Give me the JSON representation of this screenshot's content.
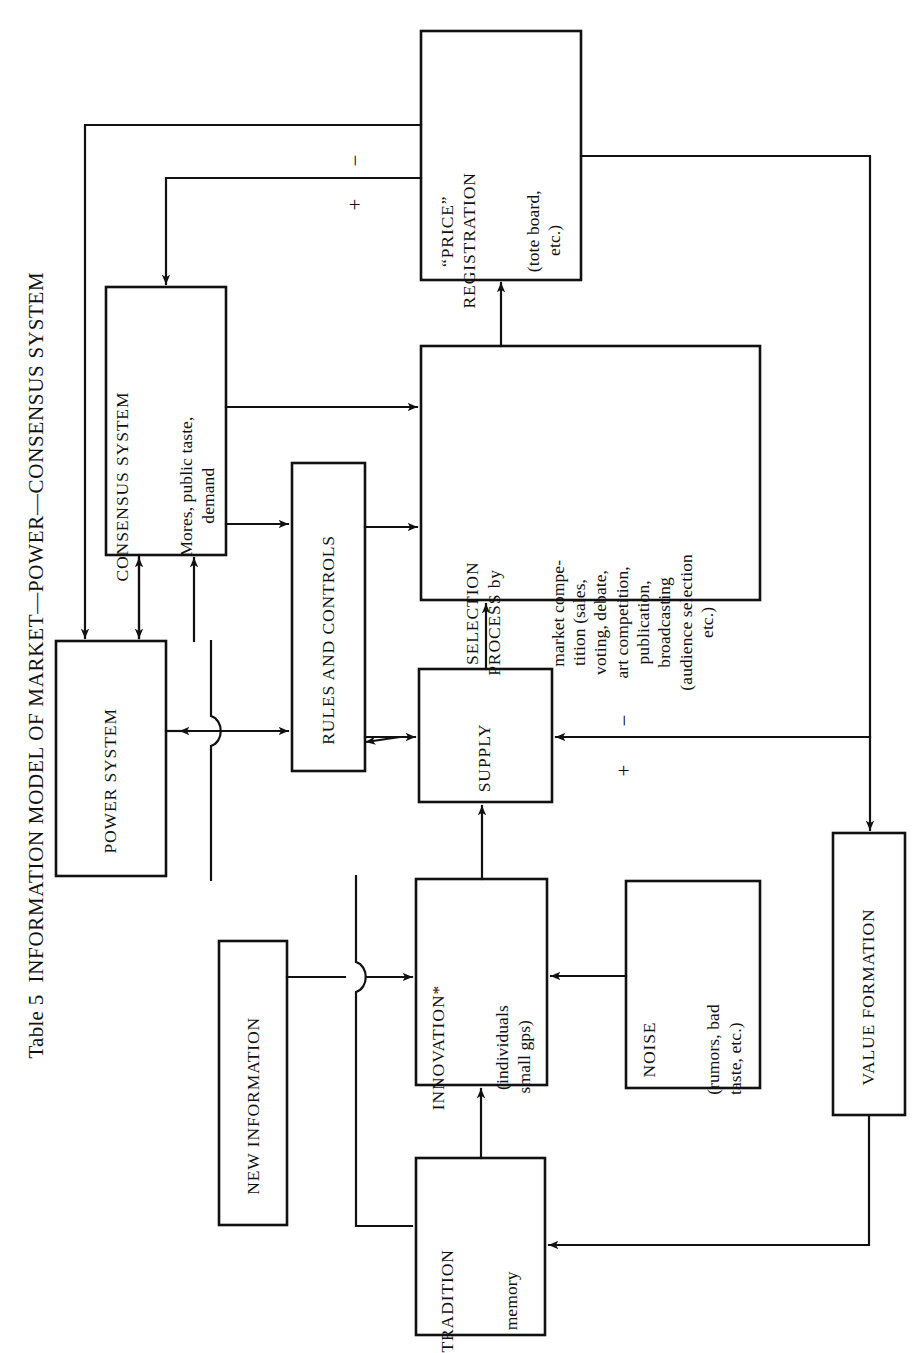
{
  "figure": {
    "caption_number": "Table 5",
    "caption_text": "INFORMATION MODEL OF MARKET—POWER—CONSENSUS SYSTEM",
    "orientation": "rotated-90-ccw",
    "ink_color": "#111111",
    "background_color": "#ffffff"
  },
  "nodes": {
    "price_registration": {
      "title": "“PRICE”\nREGISTRATION",
      "detail": "(tote board,\netc.)"
    },
    "consensus_system": {
      "title": "CONSENSUS SYSTEM",
      "detail": "Mores, public taste,\ndemand"
    },
    "power_system": {
      "title": "POWER SYSTEM",
      "detail": ""
    },
    "rules_and_controls": {
      "title": "RULES AND CONTROLS",
      "detail": ""
    },
    "selection_process": {
      "title": "SELECTION\nPROCESS by",
      "detail": "market compe-\ntition (sales,\nvoting, debate,\nart competition,\npublication,\nbroadcasting\n(audience selection\netc.)"
    },
    "supply": {
      "title": "SUPPLY",
      "detail": ""
    },
    "innovation": {
      "title": "INNOVATION*",
      "detail": "(individuals\nsmall gps)"
    },
    "noise": {
      "title": "NOISE",
      "detail": "(rumors, bad\ntaste, etc.)"
    },
    "new_information": {
      "title": "NEW INFORMATION",
      "detail": ""
    },
    "tradition": {
      "title": "TRADITION",
      "detail": "memory"
    },
    "value_formation": {
      "title": "VALUE FORMATION",
      "detail": ""
    }
  },
  "edge_labels": {
    "price_to_power_minus": "−",
    "price_to_consensus_plus": "+",
    "value_to_supply_minus": "−",
    "value_to_supply_plus": "+"
  },
  "edges": [
    {
      "from": "selection_process",
      "to": "price_registration",
      "label": ""
    },
    {
      "from": "price_registration",
      "to": "power_system",
      "label": "−"
    },
    {
      "from": "price_registration",
      "to": "consensus_system",
      "label": "+"
    },
    {
      "from": "price_registration",
      "to": "value_formation",
      "label": ""
    },
    {
      "from": "consensus_system",
      "to": "selection_process",
      "label": ""
    },
    {
      "from": "consensus_system",
      "to": "rules_and_controls",
      "label": ""
    },
    {
      "from": "consensus_system",
      "to": "power_system",
      "label": ""
    },
    {
      "from": "power_system",
      "to": "consensus_system",
      "label": ""
    },
    {
      "from": "power_system",
      "to": "rules_and_controls",
      "label": ""
    },
    {
      "from": "rules_and_controls",
      "to": "selection_process",
      "label": ""
    },
    {
      "from": "rules_and_controls",
      "to": "supply",
      "label": ""
    },
    {
      "from": "supply",
      "to": "selection_process",
      "label": ""
    },
    {
      "from": "supply",
      "to": "rules_and_controls",
      "label": ""
    },
    {
      "from": "innovation",
      "to": "supply",
      "label": ""
    },
    {
      "from": "noise",
      "to": "innovation",
      "label": ""
    },
    {
      "from": "new_information",
      "to": "innovation",
      "label": ""
    },
    {
      "from": "tradition",
      "to": "innovation",
      "label": ""
    },
    {
      "from": "value_formation",
      "to": "supply",
      "label": "− / +"
    },
    {
      "from": "value_formation",
      "to": "tradition",
      "label": ""
    },
    {
      "from": "power_system",
      "to": "new_information",
      "label": ""
    }
  ]
}
